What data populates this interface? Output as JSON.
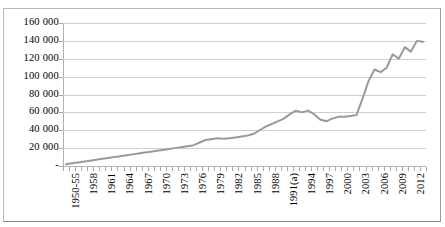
{
  "chart_data": {
    "type": "line",
    "title": "",
    "subtitle": "",
    "xlabel": "",
    "ylabel": "",
    "grid": true,
    "legend": false,
    "legend_position": "none",
    "line_color": "#9a9a9a",
    "line_width": 2,
    "markers": false,
    "ylim": [
      0,
      160000
    ],
    "ytick_step": 20000,
    "ytick_labels": [
      "160 000",
      "140 000",
      "120 000",
      "100 000",
      "80 000",
      "60 000",
      "40 000",
      "20 000",
      "-"
    ],
    "ytick_values": [
      160000,
      140000,
      120000,
      100000,
      80000,
      60000,
      40000,
      20000,
      0
    ],
    "xtick_label_every": 3,
    "xtick_labels_visible": [
      "1950-55",
      "1958",
      "1961",
      "1964",
      "1967",
      "1970",
      "1973",
      "1976",
      "1979",
      "1982",
      "1985",
      "1988",
      "1991(a)",
      "1994",
      "1997",
      "2000",
      "2003",
      "2006",
      "2009",
      "2012"
    ],
    "categories": [
      "1950-55",
      "1956",
      "1957",
      "1958",
      "1959",
      "1960",
      "1961",
      "1962",
      "1963",
      "1964",
      "1965",
      "1966",
      "1967",
      "1968",
      "1969",
      "1970",
      "1971",
      "1972",
      "1973",
      "1974",
      "1975",
      "1976",
      "1977",
      "1978",
      "1979",
      "1980",
      "1981",
      "1982",
      "1983",
      "1984",
      "1985",
      "1986",
      "1987",
      "1988",
      "1989",
      "1990",
      "1991(a)",
      "1992",
      "1993",
      "1994",
      "1995",
      "1996",
      "1997",
      "1998",
      "1999",
      "2000",
      "2001",
      "2002",
      "2003",
      "2004",
      "2005",
      "2006",
      "2007",
      "2008",
      "2009",
      "2010",
      "2011",
      "2012",
      "2013",
      "2014"
    ],
    "values": [
      2000,
      3000,
      4000,
      5000,
      6000,
      7000,
      8000,
      9000,
      10000,
      11000,
      12000,
      13000,
      14000,
      15000,
      16000,
      17000,
      18000,
      19000,
      20000,
      21000,
      22000,
      23000,
      26000,
      29000,
      30000,
      31000,
      30500,
      31000,
      32000,
      33000,
      34000,
      36000,
      40000,
      44000,
      47000,
      50000,
      53000,
      58000,
      62000,
      60000,
      62000,
      58000,
      52000,
      50000,
      53000,
      55000,
      55000,
      56000,
      57000,
      75000,
      95000,
      108000,
      105000,
      110000,
      125000,
      120000,
      133000,
      128000,
      140000,
      139000
    ]
  }
}
